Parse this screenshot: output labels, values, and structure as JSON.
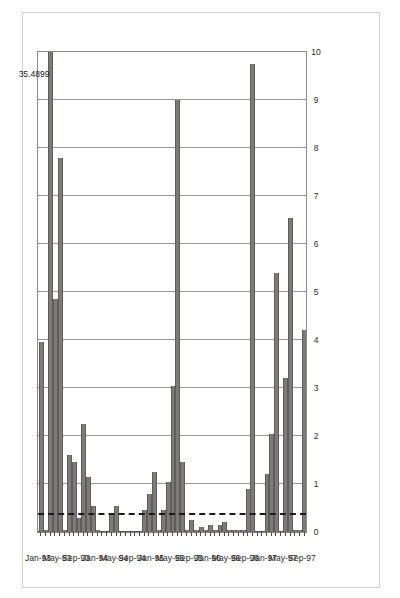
{
  "page": {
    "edge_title_fragment": "ost:"
  },
  "chart_data": {
    "type": "bar",
    "orientation": "horizontal-rotated",
    "title": "",
    "subtitle": "",
    "xlabel": "",
    "ylabel": "",
    "ylim": [
      0,
      10
    ],
    "grid": true,
    "legend": null,
    "value_ticks": [
      "0",
      "1",
      "2",
      "3",
      "4",
      "5",
      "6",
      "7",
      "8",
      "9",
      "10"
    ],
    "value_tick_values": [
      0,
      1,
      2,
      3,
      4,
      5,
      6,
      7,
      8,
      9,
      10
    ],
    "category_ticks": [
      "Jan-93",
      "May-93",
      "Sep-93",
      "Jan-94",
      "May-94",
      "Sep-94",
      "Jan-95",
      "May-95",
      "Sep-95",
      "Jan-96",
      "May-96",
      "Sep-96",
      "Jan-97",
      "May-97",
      "Sep-97"
    ],
    "reference_line": {
      "value": 0.35,
      "style": "dashed",
      "color": "#1a1a1a"
    },
    "annotations": [
      {
        "text": "35.4899",
        "category": "Mar-93",
        "note": "value label for bar clipped at axis maximum"
      }
    ],
    "bar_color": "#7d7b78",
    "categories": [
      "Jan-93",
      "Feb-93",
      "Mar-93",
      "Apr-93",
      "May-93",
      "Jun-93",
      "Jul-93",
      "Aug-93",
      "Sep-93",
      "Oct-93",
      "Nov-93",
      "Dec-93",
      "Jan-94",
      "Feb-94",
      "Mar-94",
      "Apr-94",
      "May-94",
      "Jun-94",
      "Jul-94",
      "Aug-94",
      "Sep-94",
      "Oct-94",
      "Nov-94",
      "Dec-94",
      "Jan-95",
      "Feb-95",
      "Mar-95",
      "Apr-95",
      "May-95",
      "Jun-95",
      "Jul-95",
      "Aug-95",
      "Sep-95",
      "Oct-95",
      "Nov-95",
      "Dec-95",
      "Jan-96",
      "Feb-96",
      "Mar-96",
      "Apr-96",
      "May-96",
      "Jun-96",
      "Jul-96",
      "Aug-96",
      "Sep-96",
      "Oct-96",
      "Nov-96",
      "Dec-96",
      "Jan-97",
      "Feb-97",
      "Mar-97",
      "Apr-97",
      "May-97",
      "Jun-97",
      "Jul-97",
      "Aug-97",
      "Sep-97"
    ],
    "values": [
      3.95,
      0.05,
      35.4899,
      4.85,
      7.8,
      0.05,
      1.6,
      1.45,
      0.3,
      2.25,
      1.15,
      0.55,
      0.05,
      0.0,
      0.0,
      0.35,
      0.55,
      0.0,
      0.0,
      0.0,
      0.0,
      0.0,
      0.45,
      0.8,
      1.25,
      0.05,
      0.45,
      1.05,
      3.05,
      9.0,
      1.45,
      0.05,
      0.25,
      0.05,
      0.1,
      0.05,
      0.15,
      0.05,
      0.15,
      0.2,
      0.05,
      0.05,
      0.05,
      0.05,
      0.9,
      9.75,
      0.0,
      0.0,
      1.2,
      2.05,
      5.4,
      0.0,
      3.2,
      6.55,
      0.05,
      0.05,
      4.2
    ]
  }
}
